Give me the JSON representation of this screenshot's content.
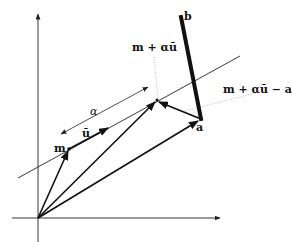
{
  "diagram": {
    "labels": {
      "m": "m",
      "u": "ū",
      "alpha": "α",
      "projection": "m + αū",
      "residual": "m + αū − a",
      "a": "a",
      "b": "b"
    },
    "colors": {
      "stroke": "#111111",
      "thin_line": "#222222",
      "dotted": "#888888",
      "background": "#ffffff"
    },
    "points": {
      "origin": [
        38,
        218
      ],
      "m": [
        69,
        149
      ],
      "u_head": [
        108,
        129
      ],
      "projection": [
        157,
        100
      ],
      "a": [
        201,
        119
      ],
      "b": [
        181,
        17
      ]
    }
  }
}
